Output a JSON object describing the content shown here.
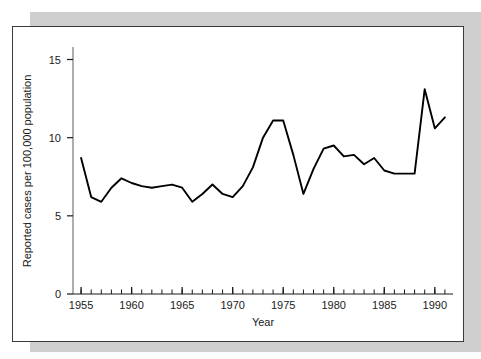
{
  "figure": {
    "panel_name": "epidemiology-line-chart-panel",
    "background_color": "#ffffff",
    "shadow_color": "#cfcfcf",
    "border_color": "#3a3a3a",
    "line_color": "#000000"
  },
  "chart_data": {
    "type": "line",
    "title": "",
    "subtitle": "",
    "xlabel": "Year",
    "ylabel": "Reported cases per 100,000 population",
    "xlim": [
      1954.2,
      1991.8
    ],
    "ylim": [
      0,
      15.8
    ],
    "grid": false,
    "legend": false,
    "legend_position": "none",
    "x_major_ticks": [
      1955,
      1960,
      1965,
      1970,
      1975,
      1980,
      1985,
      1990
    ],
    "x_major_tick_labels": [
      "1955",
      "1960",
      "1965",
      "1970",
      "1975",
      "1980",
      "1985",
      "1990"
    ],
    "x_minor_tick_interval": 1,
    "y_ticks": [
      0,
      5,
      10,
      15
    ],
    "y_tick_labels": [
      "0",
      "5",
      "10",
      "15"
    ],
    "x": [
      1955,
      1956,
      1957,
      1958,
      1959,
      1960,
      1961,
      1962,
      1963,
      1964,
      1965,
      1966,
      1967,
      1968,
      1969,
      1970,
      1971,
      1972,
      1973,
      1974,
      1975,
      1976,
      1977,
      1978,
      1979,
      1980,
      1981,
      1982,
      1983,
      1984,
      1985,
      1986,
      1987,
      1988,
      1989,
      1990,
      1991
    ],
    "values": [
      8.7,
      6.2,
      5.9,
      6.8,
      7.4,
      7.1,
      6.9,
      6.8,
      6.9,
      7.0,
      6.8,
      5.9,
      6.4,
      7.0,
      6.4,
      6.2,
      6.9,
      8.1,
      10.0,
      11.1,
      11.1,
      8.9,
      6.4,
      8.0,
      9.3,
      9.5,
      8.8,
      8.9,
      8.3,
      8.7,
      7.9,
      7.7,
      7.7,
      7.7,
      13.1,
      10.6,
      11.3
    ],
    "series": [
      {
        "name": "Reported cases per 100,000 population",
        "values": [
          8.7,
          6.2,
          5.9,
          6.8,
          7.4,
          7.1,
          6.9,
          6.8,
          6.9,
          7.0,
          6.8,
          5.9,
          6.4,
          7.0,
          6.4,
          6.2,
          6.9,
          8.1,
          10.0,
          11.1,
          11.1,
          8.9,
          6.4,
          8.0,
          9.3,
          9.5,
          8.8,
          8.9,
          8.3,
          8.7,
          7.9,
          7.7,
          7.7,
          7.7,
          13.1,
          10.6,
          11.3
        ]
      }
    ]
  }
}
